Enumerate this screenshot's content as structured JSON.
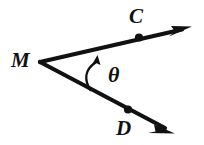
{
  "figure": {
    "kind": "geometry-angle-diagram",
    "background_color": "#ffffff",
    "stroke_color": "#111111",
    "labels": {
      "vertex": "M",
      "upper_point": "C",
      "lower_point": "D",
      "angle": "θ"
    },
    "geometry": {
      "vertex": {
        "x": 40,
        "y": 62
      },
      "upper_ray": {
        "name": "ray-MC",
        "start": {
          "x": 40,
          "y": 62
        },
        "end": {
          "x": 192,
          "y": 27
        },
        "marked_point": {
          "x": 139,
          "y": 37,
          "label": "C"
        },
        "arrow": "end",
        "stroke_width": 4
      },
      "lower_ray": {
        "name": "ray-MD",
        "start": {
          "x": 40,
          "y": 62
        },
        "end": {
          "x": 174,
          "y": 133
        },
        "marked_point": {
          "x": 128,
          "y": 110,
          "label": "D"
        },
        "arrow": "end",
        "stroke_width": 4
      },
      "angle_arc": {
        "name": "angle-arc-theta",
        "from": {
          "x": 90,
          "y": 89
        },
        "to": {
          "x": 97,
          "y": 57
        },
        "control": {
          "x": 84,
          "y": 72
        },
        "arrow": "end",
        "stroke_width": 2
      },
      "dot_radius": 4
    }
  }
}
